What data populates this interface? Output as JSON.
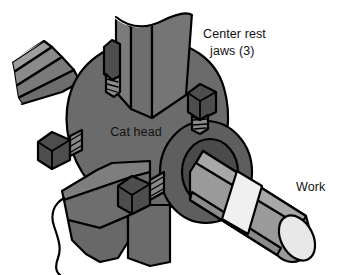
{
  "figure": {
    "background_color": "#ffffff",
    "outline_color": "#000000",
    "width": 342,
    "height": 275
  },
  "labels": {
    "center_rest_jaws_line1": "Center rest",
    "center_rest_jaws_line2": "jaws (3)",
    "cat_head": "Cat head",
    "work": "Work"
  },
  "parts": {
    "cat_head_body": {
      "name": "Cat head",
      "color": "#6b6b6b"
    },
    "hub_boss": {
      "name": "Cat head hub",
      "color": "#5e5e5e"
    },
    "hub_bore": {
      "name": "Hub bore",
      "color": "#4f4f4f"
    },
    "work_shaft": {
      "name": "Work",
      "color": "#9a9a9a"
    },
    "work_end_face": {
      "name": "Work end face",
      "color": "#e6e6e6"
    },
    "work_band": {
      "name": "Work band",
      "color": "#f2f2f2"
    },
    "jaw_top": {
      "name": "Center rest jaw (top)",
      "color": "#6f6f6f"
    },
    "jaw_upper_left": {
      "name": "Center rest jaw (upper left)",
      "color": "#888888"
    },
    "jaw_lower_left": {
      "name": "Center rest jaw (lower left)",
      "color": "#6f6f6f"
    },
    "adjusting_screws": {
      "name": "Adjusting screws",
      "head_color": "#4a4a4a",
      "thread_color": "#8c8c8c",
      "count": 4
    }
  },
  "colors": {
    "white": "#ffffff",
    "black": "#000000",
    "body_gray": "#6b6b6b",
    "light_gray": "#9a9a9a",
    "mid_gray": "#7d7d7d",
    "dark_gray": "#4a4a4a",
    "pale_gray": "#b0b0b0",
    "near_white": "#e6e6e6"
  }
}
